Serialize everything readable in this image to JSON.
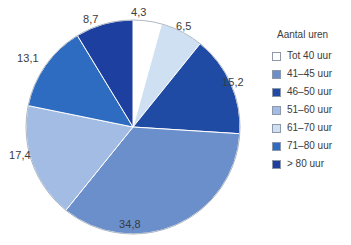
{
  "chart_data": {
    "type": "pie",
    "title": "",
    "legend_title": "Aantal uren",
    "legend_position": "right",
    "categories": [
      "Tot 40 uur",
      "41–45 uur",
      "46–50 uur",
      "51–60 uur",
      "61–70 uur",
      "71–80 uur",
      "> 80 uur"
    ],
    "values": [
      4.3,
      34.8,
      15.2,
      17.4,
      6.5,
      13.1,
      8.7
    ],
    "value_labels": [
      "4,3",
      "34,8",
      "15,2",
      "17,4",
      "6,5",
      "13,1",
      "8,7"
    ],
    "colors": [
      "#ffffff",
      "#6a8fcb",
      "#1f4ba5",
      "#a3bce4",
      "#cfe0f2",
      "#2d6cc0",
      "#1c3fa0"
    ],
    "slice_order_clockwise_from_top": [
      {
        "label": "4,3",
        "value": 4.3,
        "category": "Tot 40 uur",
        "color": "#ffffff"
      },
      {
        "label": "6,5",
        "value": 6.5,
        "category": "61–70 uur",
        "color": "#cfe0f2"
      },
      {
        "label": "15,2",
        "value": 15.2,
        "category": "46–50 uur",
        "color": "#1f4ba5"
      },
      {
        "label": "34,8",
        "value": 34.8,
        "category": "41–45 uur",
        "color": "#6a8fcb"
      },
      {
        "label": "17,4",
        "value": 17.4,
        "category": "51–60 uur",
        "color": "#a3bce4"
      },
      {
        "label": "13,1",
        "value": 13.1,
        "category": "71–80 uur",
        "color": "#2d6cc0"
      },
      {
        "label": "8,7",
        "value": 8.7,
        "category": "> 80 uur",
        "color": "#1c3fa0"
      }
    ],
    "total": 100.0,
    "grid": false
  },
  "legend": {
    "title": "Aantal uren",
    "items": [
      {
        "label": "Tot 40 uur",
        "color": "#ffffff"
      },
      {
        "label": "41–45 uur",
        "color": "#6a8fcb"
      },
      {
        "label": "46–50 uur",
        "color": "#1f4ba5"
      },
      {
        "label": "51–60 uur",
        "color": "#a3bce4"
      },
      {
        "label": "61–70 uur",
        "color": "#cfe0f2"
      },
      {
        "label": "71–80 uur",
        "color": "#2d6cc0"
      },
      {
        "label": "> 80 uur",
        "color": "#1c3fa0"
      }
    ]
  },
  "labels": {
    "top_left": "8,7",
    "top_center": "4,3",
    "top_right": "6,5",
    "right": "15,2",
    "bottom": "34,8",
    "left_lower": "17,4",
    "left_upper": "13,1"
  }
}
